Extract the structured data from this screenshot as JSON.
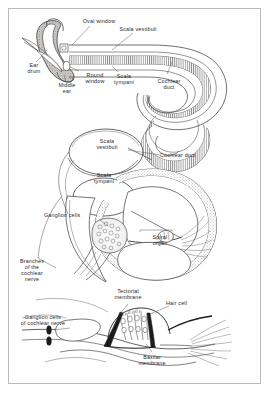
{
  "figure": {
    "border_color": "#b9b9b9",
    "background": "#ffffff",
    "ink_color": "#3a3a3a",
    "label_color": "#2a2a2a"
  },
  "labels": {
    "oval_window": "Oval window",
    "scala_vestibuli_top": "Scala vestibuli",
    "ear_drum": "Ear\ndrum",
    "middle_ear": "Middle\near",
    "round_window": "Round\nwindow",
    "scala_tympani_top": "Scala\ntympani",
    "cochlear_duct_top": "Cochlear\nduct",
    "scala_vestibuli_mid": "Scala\nvestibuli",
    "cochlear_duct_mid": "Cochlear duct",
    "scala_tympani_mid": "Scala\ntympani",
    "ganglion_cells": "Ganglion cells",
    "spiral_organ": "Spiral\norgan",
    "branches_cochlear_nerve": "Branches\nof the\ncochlear\nnerve",
    "tectorial_membrane": "Tectorial\nmembrane",
    "hair_cell": "Hair cell",
    "ganglion_cells_cochlear_nerve": "Ganglion cells\nof cochlear nerve",
    "basilar_membrane": "Basilar\nmembrane"
  }
}
